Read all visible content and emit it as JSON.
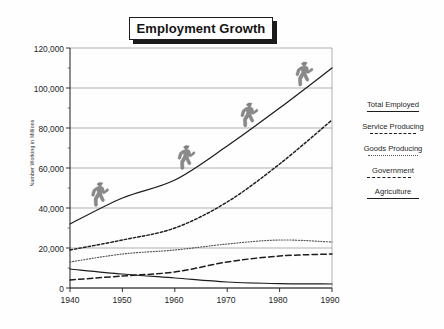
{
  "title": "Employment Growth",
  "axes": {
    "ylabel": "Number Working in Millions",
    "yticks": [
      "120,000",
      "100,000",
      "80,000",
      "60,000",
      "40,000",
      "20,000",
      "0"
    ],
    "xticks": [
      "1940",
      "1950",
      "1960",
      "1970",
      "1980",
      "1990"
    ]
  },
  "legend": {
    "items": [
      {
        "label": "Total Employed",
        "style": "solid"
      },
      {
        "label": "Service Producing",
        "style": "dashed-medium"
      },
      {
        "label": "Goods Producing",
        "style": "dotted-fine"
      },
      {
        "label": "Government",
        "style": "dashed-long"
      },
      {
        "label": "Agriculture",
        "style": "solid"
      }
    ]
  },
  "decoration": {
    "walker_icon": "walking-person-icon",
    "walker_count": 4,
    "walker_color": "#8a8a8a"
  },
  "colors": {
    "line": "#1d1d1d",
    "grid": "#8f8f8f",
    "dotted": "#565656",
    "background": "#fefefe",
    "title_text": "#141414"
  },
  "chart_data": {
    "type": "line",
    "title": "Employment Growth",
    "xlabel": "",
    "ylabel": "Number Working in Millions",
    "x": [
      1940,
      1950,
      1960,
      1970,
      1980,
      1990
    ],
    "xlim": [
      1940,
      1990
    ],
    "ylim": [
      0,
      120000
    ],
    "ytick_values": [
      0,
      20000,
      40000,
      60000,
      80000,
      100000,
      120000
    ],
    "grid": true,
    "legend_position": "right",
    "series": [
      {
        "name": "Total Employed",
        "style": "solid",
        "values": [
          32000,
          45000,
          54000,
          71000,
          90000,
          110000
        ]
      },
      {
        "name": "Service Producing",
        "style": "dashed-medium",
        "values": [
          19000,
          24000,
          30000,
          43000,
          62000,
          84000
        ]
      },
      {
        "name": "Goods Producing",
        "style": "dotted-fine",
        "values": [
          13000,
          17000,
          19000,
          22000,
          24000,
          23000
        ]
      },
      {
        "name": "Government",
        "style": "dashed-long",
        "values": [
          4000,
          6000,
          8000,
          13000,
          16000,
          17000
        ]
      },
      {
        "name": "Agriculture",
        "style": "solid",
        "values": [
          9500,
          7000,
          5000,
          3000,
          2200,
          2000
        ]
      }
    ]
  }
}
